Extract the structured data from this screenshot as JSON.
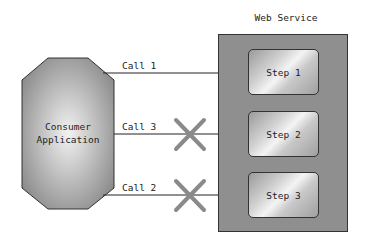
{
  "diagram": {
    "consumer": {
      "line1": "Consumer",
      "line2": "Application"
    },
    "web_service": {
      "title": "Web Service",
      "steps": [
        {
          "label": "Step 1"
        },
        {
          "label": "Step 2"
        },
        {
          "label": "Step 3"
        }
      ]
    },
    "calls": [
      {
        "label": "Call 1",
        "target": "Step 1",
        "blocked": false
      },
      {
        "label": "Call 3",
        "target": "Step 2",
        "blocked": true
      },
      {
        "label": "Call 2",
        "target": "Step 3",
        "blocked": true
      }
    ],
    "colors": {
      "container": "#8f8f8f",
      "cross": "#8a8a8a",
      "line": "#222222"
    }
  }
}
